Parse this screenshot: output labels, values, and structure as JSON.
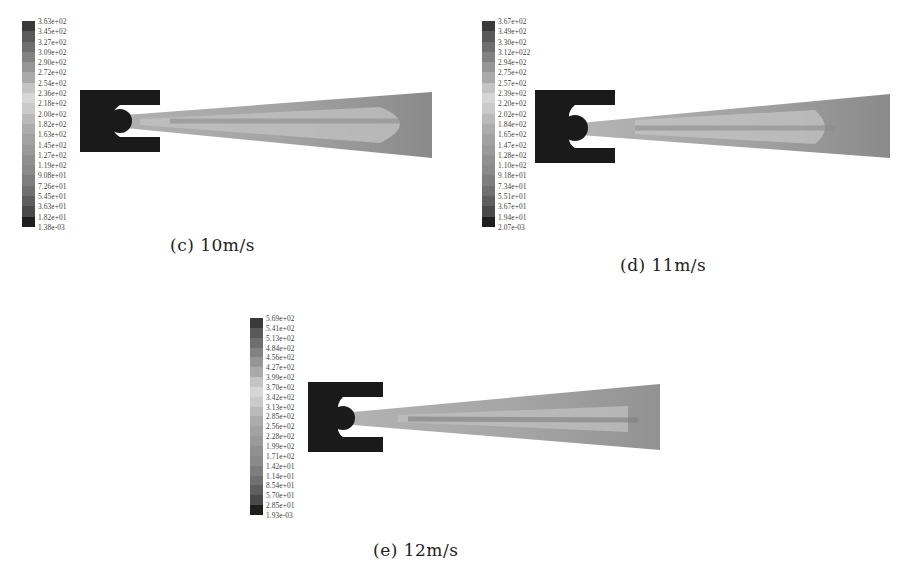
{
  "figure": {
    "panels": [
      {
        "id": "c",
        "caption": "(c)  10m/s",
        "velocity": "10m/s",
        "colorbar_ticks": [
          "3.63e+02",
          "3.45e+02",
          "3.27e+02",
          "3.09e+02",
          "2.90e+02",
          "2.72e+02",
          "2.54e+02",
          "2.36e+02",
          "2.18e+02",
          "2.00e+02",
          "1.82e+02",
          "1.63e+02",
          "1.45e+02",
          "1.27e+02",
          "1.19e+02",
          "9.08e+01",
          "7.26e+01",
          "5.45e+01",
          "3.63e+01",
          "1.82e+01",
          "1.38e-03"
        ]
      },
      {
        "id": "d",
        "caption": "(d)  11m/s",
        "velocity": "11m/s",
        "colorbar_ticks": [
          "3.67e+02",
          "3.49e+02",
          "3.30e+02",
          "3.12e+022",
          "2.94e+02",
          "2.75e+02",
          "2.57e+02",
          "2.39e+02",
          "2.20e+02",
          "2.02e+02",
          "1.84e+02",
          "1.65e+02",
          "1.47e+02",
          "1.28e+02",
          "1.10e+02",
          "9.18e+01",
          "7.34e+01",
          "5.51e+01",
          "3.67e+01",
          "1.94e+01",
          "2.07e-03"
        ]
      },
      {
        "id": "e",
        "caption": "(e)  12m/s",
        "velocity": "12m/s",
        "colorbar_ticks": [
          "5.69e+02",
          "5.41e+02",
          "5.13e+02",
          "4.84e+02",
          "4.56e+02",
          "4.27e+02",
          "3.99e+02",
          "3.70e+02",
          "3.42e+02",
          "3.13e+02",
          "2.85e+02",
          "2.56e+02",
          "2.28e+02",
          "1.99e+02",
          "1.71e+02",
          "1.42e+01",
          "1.14e+01",
          "8.54e+01",
          "5.70e+01",
          "2.85e+01",
          "1.93e-03"
        ]
      }
    ],
    "colorbar_shades": [
      "#3a3a3a",
      "#5a5a5a",
      "#6e6e6e",
      "#828282",
      "#969696",
      "#aaaaaa",
      "#c4c4c4",
      "#d6d6d6",
      "#cacaca",
      "#bababa",
      "#acacac",
      "#a2a2a2",
      "#9a9a9a",
      "#909090",
      "#8a8a8a",
      "#7e7e7e",
      "#707070",
      "#5e5e5e",
      "#4a4a4a",
      "#1e1e1e"
    ]
  }
}
